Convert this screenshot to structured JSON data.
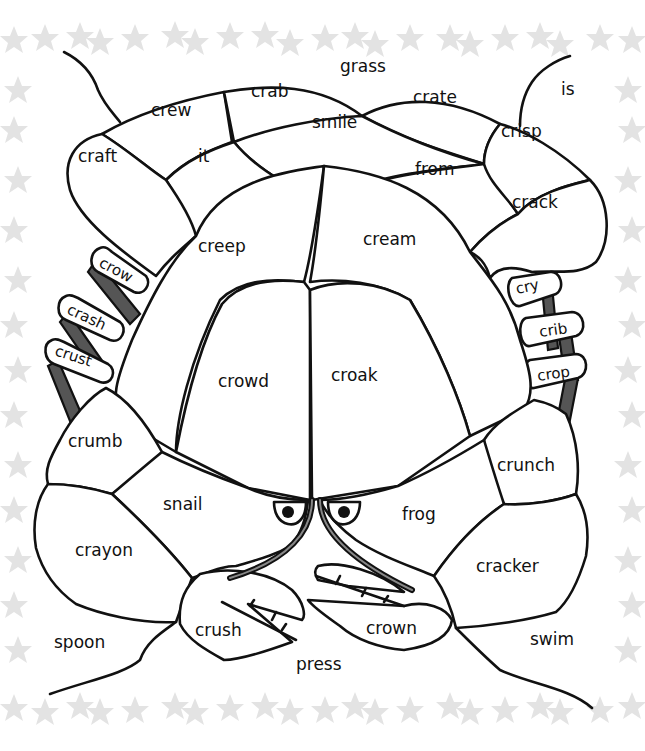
{
  "worksheet": {
    "subject": "crab colour-by-word worksheet",
    "border_motif": "starfish-border",
    "colors": {
      "ink": "#111111",
      "background": "#ffffff",
      "border_stars": "#e3e3e3",
      "leg_shading": "#555555"
    },
    "words": {
      "grass": "grass",
      "is": "is",
      "crab": "crab",
      "crate": "crate",
      "crew": "crew",
      "smile": "smile",
      "crisp": "crisp",
      "craft": "craft",
      "it": "it",
      "from": "from",
      "crack": "crack",
      "creep": "creep",
      "cream": "cream",
      "crow": "crow",
      "crash": "crash",
      "crust": "crust",
      "cry": "cry",
      "crib": "crib",
      "crop": "crop",
      "crowd": "crowd",
      "croak": "croak",
      "crumb": "crumb",
      "crunch": "crunch",
      "snail": "snail",
      "frog": "frog",
      "crayon": "crayon",
      "cracker": "cracker",
      "crush": "crush",
      "crown": "crown",
      "spoon": "spoon",
      "press": "press",
      "swim": "swim"
    }
  }
}
